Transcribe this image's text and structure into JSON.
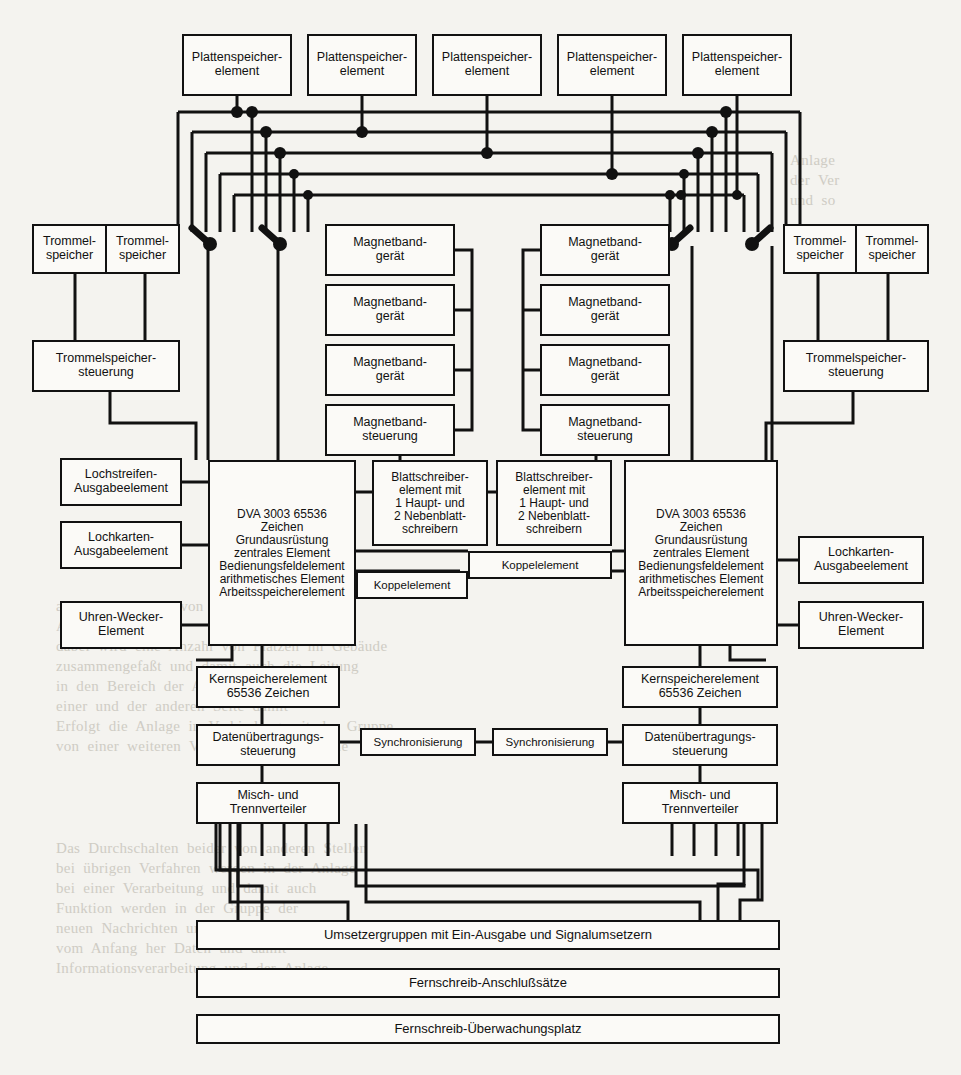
{
  "diagram": {
    "background_color": "#f4f3ef",
    "line_color": "#111111",
    "box_fill": "#fbfaf7"
  },
  "disk_storage_row": {
    "label": "Plattenspeicherelement",
    "count": 5,
    "items": [
      {
        "label": "Plattenspeicher-\nelement"
      },
      {
        "label": "Plattenspeicher-\nelement"
      },
      {
        "label": "Plattenspeicher-\nelement"
      },
      {
        "label": "Plattenspeicher-\nelement"
      },
      {
        "label": "Plattenspeicher-\nelement"
      }
    ]
  },
  "drum_storage": {
    "left": {
      "units": [
        {
          "label": "Trommel-\nspeicher"
        },
        {
          "label": "Trommel-\nspeicher"
        }
      ],
      "controller": "Trommelspeicher-\nsteuerung"
    },
    "right": {
      "units": [
        {
          "label": "Trommel-\nspeicher"
        },
        {
          "label": "Trommel-\nspeicher"
        }
      ],
      "controller": "Trommelspeicher-\nsteuerung"
    }
  },
  "magnetic_tape": {
    "left": {
      "drives": [
        {
          "label": "Magnetband-\ngerät"
        },
        {
          "label": "Magnetband-\ngerät"
        },
        {
          "label": "Magnetband-\ngerät"
        }
      ],
      "controller": "Magnetband-\nsteuerung"
    },
    "right": {
      "drives": [
        {
          "label": "Magnetband-\ngerät"
        },
        {
          "label": "Magnetband-\ngerät"
        },
        {
          "label": "Magnetband-\ngerät"
        }
      ],
      "controller": "Magnetband-\nsteuerung"
    }
  },
  "central_units": {
    "left": "DVA 3003 65536\nZeichen\nGrundausrüstung\nzentrales Element\nBedienungsfeldelement\narithmetisches Element\nArbeitsspeicherelement",
    "right": "DVA 3003 65536\nZeichen\nGrundausrüstung\nzentrales Element\nBedienungsfeldelement\narithmetisches Element\nArbeitsspeicherelement"
  },
  "page_printers": {
    "left": "Blattschreiber-\nelement mit\n1 Haupt- und\n2 Nebenblatt-\nschreibern",
    "right": "Blattschreiber-\nelement mit\n1 Haupt- und\n2 Nebenblatt-\nschreibern"
  },
  "coupling_elements": [
    {
      "label": "Koppelelement"
    },
    {
      "label": "Koppelelement"
    }
  ],
  "left_peripherals": [
    {
      "label": "Lochstreifen-\nAusgabeelement"
    },
    {
      "label": "Lochkarten-\nAusgabeelement"
    },
    {
      "label": "Uhren-Wecker-\nElement"
    }
  ],
  "right_peripherals": [
    {
      "label": "Lochkarten-\nAusgabeelement"
    },
    {
      "label": "Uhren-Wecker-\nElement"
    }
  ],
  "core_memory": {
    "left": "Kernspeicherelement\n65536 Zeichen",
    "right": "Kernspeicherelement\n65536 Zeichen"
  },
  "data_transmission": {
    "left": "Datenübertragungs-\nsteuerung",
    "right": "Datenübertragungs-\nsteuerung"
  },
  "synchronisation": [
    {
      "label": "Synchronisierung"
    },
    {
      "label": "Synchronisierung"
    }
  ],
  "distributors": {
    "left": "Misch- und\nTrennverteiler",
    "right": "Misch- und\nTrennverteiler"
  },
  "bottom_bars": [
    {
      "label": "Umsetzergruppen mit Ein-Ausgabe und Signalumsetzern"
    },
    {
      "label": "Fernschreib-Anschlußsätze"
    },
    {
      "label": "Fernschreib-Überwachungsplatz"
    }
  ],
  "bus": {
    "count": 5,
    "description": "fünf horizontale Sammelschienen"
  }
}
